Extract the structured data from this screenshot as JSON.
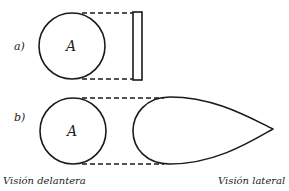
{
  "figure": {
    "type": "diagram",
    "panels": [
      {
        "label": "a)",
        "front_view_text": "A",
        "side_shape": "flat plate (thin rectangle)"
      },
      {
        "label": "b)",
        "front_view_text": "A",
        "side_shape": "streamlined teardrop"
      }
    ],
    "captions": {
      "front": "Visión delantera",
      "side": "Visión lateral"
    },
    "colors": {
      "stroke": "#1a1a1a",
      "background": "#ffffff"
    }
  }
}
